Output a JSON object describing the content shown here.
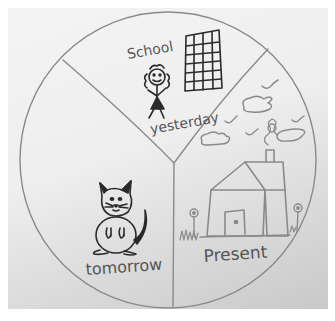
{
  "drawing": {
    "description": "Hand-drawn pie-style circle divided into three sections labeled yesterday, Present and tomorrow",
    "colors": {
      "paper": "#eeeeee",
      "pencil": "#8a8a8a",
      "ink": "#2a2a2a"
    },
    "sections": [
      {
        "id": "yesterday",
        "label": "yesterday",
        "extra_text": "School",
        "items": [
          "school-building",
          "girl-stick-figure"
        ]
      },
      {
        "id": "present",
        "label": "Present",
        "items": [
          "house",
          "chimney-smoke",
          "clouds",
          "birds",
          "flowers",
          "grass"
        ]
      },
      {
        "id": "tomorrow",
        "label": "tomorrow",
        "items": [
          "cat"
        ]
      }
    ]
  }
}
